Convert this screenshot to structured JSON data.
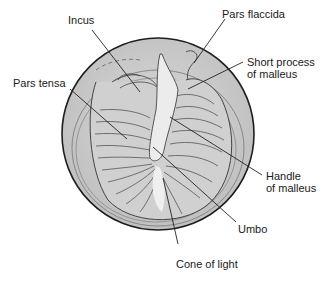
{
  "figure": {
    "colors": {
      "background": "#ffffff",
      "membrane_fill": "#c9c9c9",
      "membrane_light": "#e2e2e2",
      "outline": "#1e1e1e",
      "label_text": "#1a1a1a"
    },
    "labels": {
      "incus": "Incus",
      "pars_flaccida": "Pars flaccida",
      "short_process_1": "Short process",
      "short_process_2": "of malleus",
      "pars_tensa": "Pars tensa",
      "handle_1": "Handle",
      "handle_2": "of malleus",
      "umbo": "Umbo",
      "cone_of_light": "Cone of light"
    }
  }
}
